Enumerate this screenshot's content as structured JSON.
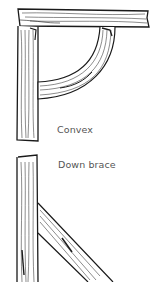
{
  "figure": {
    "panels": [
      {
        "id": "convex",
        "label": "Convex"
      },
      {
        "id": "down_brace",
        "label": "Down brace"
      }
    ],
    "colors": {
      "ink": "#1a1a1a",
      "label": "#555555",
      "background": "#ffffff"
    }
  }
}
